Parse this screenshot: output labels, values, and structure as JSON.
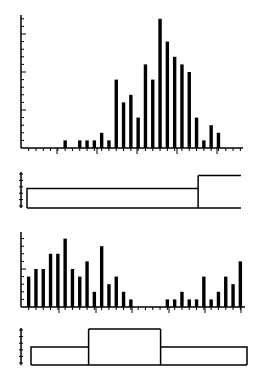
{
  "chart_data": [
    {
      "type": "bar",
      "title": "",
      "xlabel": "",
      "ylabel": "",
      "grid": false,
      "legend": null,
      "ylim": [
        0,
        17
      ],
      "y_major_tick_every": 5,
      "y_minor_tick_every": 1,
      "x": [
        1,
        2,
        3,
        4,
        5,
        6,
        7,
        8,
        9,
        10,
        11,
        12,
        13,
        14,
        15,
        16,
        17,
        18,
        19,
        20,
        21,
        22,
        23,
        24,
        25,
        26,
        27,
        28,
        29,
        30
      ],
      "values": [
        0,
        0,
        0,
        0,
        0,
        1,
        0,
        1,
        1,
        1,
        2,
        1,
        9,
        6,
        7,
        4,
        11,
        9,
        17,
        14,
        12,
        11,
        10,
        4,
        1,
        3,
        2,
        0,
        0,
        0
      ],
      "color": "#000000"
    },
    {
      "type": "line",
      "subtype": "step",
      "title": "",
      "xlabel": "",
      "ylabel": "",
      "ylim": [
        0,
        5
      ],
      "segments": [
        {
          "x_start": 0,
          "x_end": 24,
          "value": 3
        },
        {
          "x_start": 24,
          "x_end": 30,
          "value": 5
        }
      ],
      "color": "#000000"
    },
    {
      "type": "bar",
      "title": "",
      "xlabel": "",
      "ylabel": "",
      "grid": false,
      "legend": null,
      "ylim": [
        0,
        9
      ],
      "y_major_tick_every": 5,
      "y_minor_tick_every": 1,
      "x": [
        1,
        2,
        3,
        4,
        5,
        6,
        7,
        8,
        9,
        10,
        11,
        12,
        13,
        14,
        15,
        16,
        17,
        18,
        19,
        20,
        21,
        22,
        23,
        24,
        25,
        26,
        27,
        28,
        29,
        30
      ],
      "values": [
        4,
        5,
        5,
        7,
        7,
        9,
        5,
        4,
        6,
        2,
        8,
        3,
        4,
        2,
        1,
        0,
        0,
        0,
        0,
        1,
        1,
        2,
        1,
        1,
        4,
        1,
        2,
        4,
        3,
        6
      ],
      "color": "#000000"
    },
    {
      "type": "line",
      "subtype": "step",
      "title": "",
      "xlabel": "",
      "ylabel": "",
      "ylim": [
        0,
        5
      ],
      "segments": [
        {
          "x_start": 0,
          "x_end": 8,
          "value": 2.5
        },
        {
          "x_start": 8,
          "x_end": 18,
          "value": 5
        },
        {
          "x_start": 18,
          "x_end": 30,
          "value": 2.5
        }
      ],
      "color": "#000000"
    }
  ]
}
